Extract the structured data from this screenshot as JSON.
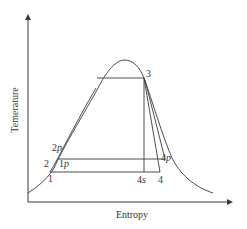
{
  "diagram": {
    "type": "T-s diagram (vapor dome with cycle points)",
    "axes": {
      "x_label": "Entropy",
      "y_label": "Temerature"
    },
    "points": {
      "p1": {
        "num": "1",
        "sub": ""
      },
      "p2": {
        "num": "2",
        "sub": ""
      },
      "p2p": {
        "num": "2",
        "sub": "p"
      },
      "p1p": {
        "num": "1",
        "sub": "p"
      },
      "p3": {
        "num": "3",
        "sub": ""
      },
      "p4s": {
        "num": "4",
        "sub": "s"
      },
      "p4": {
        "num": "4",
        "sub": ""
      },
      "p4p": {
        "num": "4",
        "sub": "p"
      }
    },
    "colors": {
      "line": "#3a3a3a",
      "text": "#333333",
      "background": "#ffffff"
    }
  }
}
